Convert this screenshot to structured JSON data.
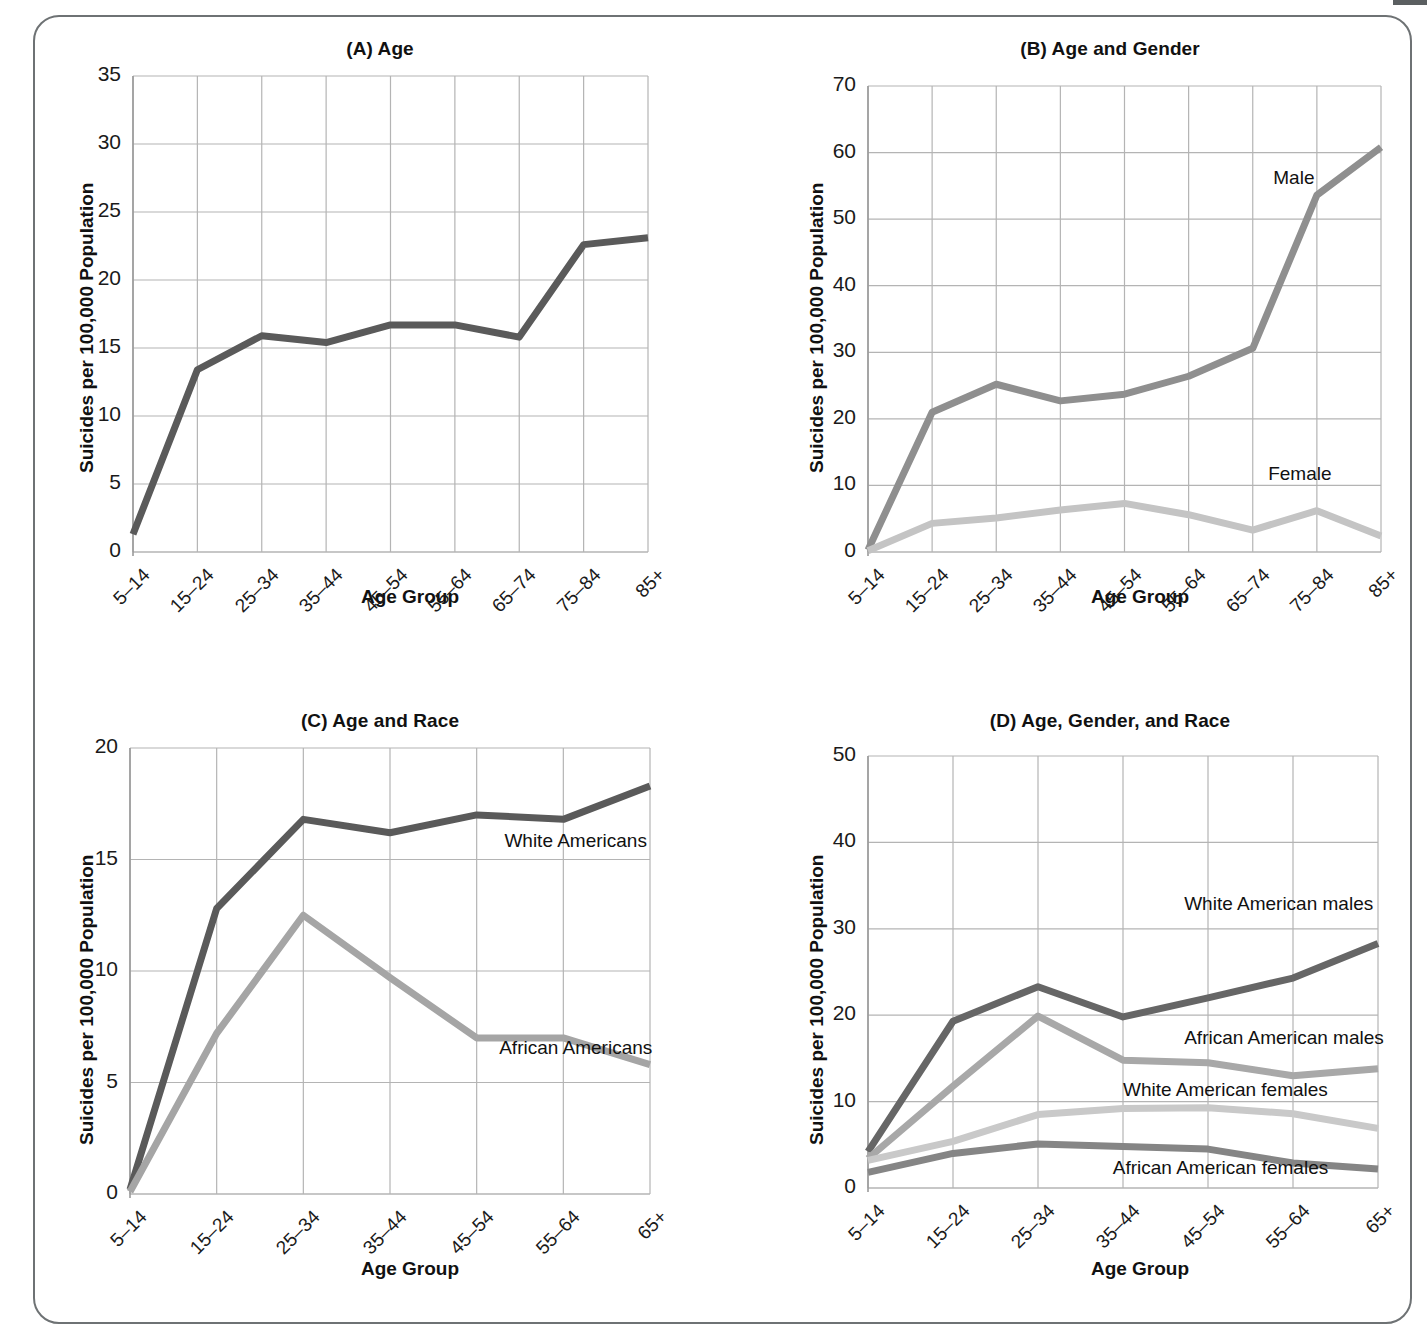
{
  "figure": {
    "frame_color": "#6e7274",
    "background": "#ffffff"
  },
  "common": {
    "ylabel": "Suicides per 100,000 Population",
    "xlabel": "Age Group"
  },
  "chart_data": [
    {
      "id": "A",
      "type": "line",
      "title": "(A) Age",
      "xlabel": "Age Group",
      "ylabel": "Suicides per 100,000 Population",
      "categories": [
        "5–14",
        "15–24",
        "25–34",
        "35–44",
        "45–54",
        "55–64",
        "65–74",
        "75–84",
        "85+"
      ],
      "ylim": [
        0,
        35
      ],
      "yticks": [
        0,
        5,
        10,
        15,
        20,
        25,
        30,
        35
      ],
      "grid": true,
      "legend": "none",
      "series": [
        {
          "name": "All",
          "color": "#5a5a5a",
          "values": [
            1.3,
            13.4,
            15.9,
            15.4,
            16.7,
            16.7,
            15.8,
            22.6,
            23.1
          ]
        }
      ]
    },
    {
      "id": "B",
      "type": "line",
      "title": "(B) Age and Gender",
      "xlabel": "Age Group",
      "ylabel": "Suicides per 100,000 Population",
      "categories": [
        "5–14",
        "15–24",
        "25–34",
        "35–44",
        "45–54",
        "55–64",
        "65–74",
        "75–84",
        "85+"
      ],
      "ylim": [
        0,
        70
      ],
      "yticks": [
        0,
        10,
        20,
        30,
        40,
        50,
        60,
        70
      ],
      "grid": true,
      "legend": "inline",
      "series": [
        {
          "name": "Male",
          "color": "#8f8f8f",
          "label": "Male",
          "values": [
            0.3,
            21.0,
            25.2,
            22.7,
            23.7,
            26.4,
            30.6,
            53.6,
            60.8
          ]
        },
        {
          "name": "Female",
          "color": "#c4c4c4",
          "label": "Female",
          "values": [
            0.2,
            4.3,
            5.1,
            6.3,
            7.3,
            5.6,
            3.3,
            6.2,
            2.4
          ]
        }
      ]
    },
    {
      "id": "C",
      "type": "line",
      "title": "(C) Age and Race",
      "xlabel": "Age Group",
      "ylabel": "Suicides per 100,000 Population",
      "categories": [
        "5–14",
        "15–24",
        "25–34",
        "35–44",
        "45–54",
        "55–64",
        "65+"
      ],
      "ylim": [
        0,
        20
      ],
      "yticks": [
        0,
        5,
        10,
        15,
        20
      ],
      "grid": true,
      "legend": "inline",
      "series": [
        {
          "name": "White Americans",
          "color": "#5a5a5a",
          "label": "White Americans",
          "values": [
            0.2,
            12.8,
            16.8,
            16.2,
            17.0,
            16.8,
            18.3
          ]
        },
        {
          "name": "African Americans",
          "color": "#a5a5a5",
          "label": "African Americans",
          "values": [
            0.1,
            7.2,
            12.5,
            9.7,
            7.0,
            7.0,
            5.8
          ]
        }
      ]
    },
    {
      "id": "D",
      "type": "line",
      "title": "(D) Age, Gender, and Race",
      "xlabel": "Age Group",
      "ylabel": "Suicides per 100,000 Population",
      "categories": [
        "5–14",
        "15–24",
        "25–34",
        "35–44",
        "45–54",
        "55–64",
        "65+"
      ],
      "ylim": [
        0,
        50
      ],
      "yticks": [
        0,
        10,
        20,
        30,
        40,
        50
      ],
      "grid": true,
      "legend": "inline",
      "series": [
        {
          "name": "White American males",
          "color": "#666666",
          "label": "White American males",
          "values": [
            4.2,
            19.3,
            23.3,
            19.8,
            22.0,
            24.3,
            28.3
          ]
        },
        {
          "name": "African American males",
          "color": "#a8a8a8",
          "label": "African American males",
          "values": [
            3.4,
            11.8,
            19.9,
            14.8,
            14.5,
            13.0,
            13.8
          ]
        },
        {
          "name": "White American females",
          "color": "#c9c9c9",
          "label": "White American females",
          "values": [
            3.2,
            5.4,
            8.5,
            9.2,
            9.3,
            8.6,
            6.9
          ]
        },
        {
          "name": "African American females",
          "color": "#858585",
          "label": "African American females",
          "values": [
            1.8,
            4.0,
            5.1,
            4.8,
            4.5,
            2.9,
            2.2
          ]
        }
      ]
    }
  ]
}
